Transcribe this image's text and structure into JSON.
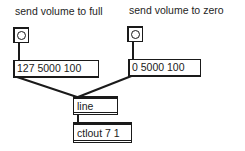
{
  "patch": {
    "comments": [
      {
        "id": "label-full",
        "text": "send volume to full"
      },
      {
        "id": "label-zero",
        "text": "send volume to zero"
      }
    ],
    "bangs": [
      {
        "id": "bang-full"
      },
      {
        "id": "bang-zero"
      }
    ],
    "messages": [
      {
        "id": "msg-full",
        "text": "127 5000 100"
      },
      {
        "id": "msg-zero",
        "text": "0 5000 100"
      }
    ],
    "objects": [
      {
        "id": "obj-line",
        "text": "line"
      },
      {
        "id": "obj-ctlout",
        "text": "ctlout 7 1"
      }
    ],
    "connections": [
      {
        "from": "bang-full",
        "to": "msg-full"
      },
      {
        "from": "bang-zero",
        "to": "msg-zero"
      },
      {
        "from": "msg-full",
        "to": "obj-line"
      },
      {
        "from": "msg-zero",
        "to": "obj-line"
      },
      {
        "from": "obj-line",
        "to": "obj-ctlout"
      }
    ],
    "colors": {
      "ink": "#1a1a1a",
      "background": "#ffffff"
    }
  }
}
